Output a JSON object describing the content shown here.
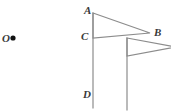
{
  "figure": {
    "background_color": "#ffffff",
    "stroke_color": "#8c8c8c",
    "label_color": "#3a3a3a",
    "point_color": "#111111",
    "labels": {
      "center_point": "O",
      "vertex_a": "A",
      "vertex_b": "B",
      "vertex_c": "C",
      "vertex_d": "D"
    },
    "points": {
      "O": {
        "x": 13,
        "y": 38
      },
      "A": {
        "x": 93,
        "y": 13
      },
      "B": {
        "x": 150,
        "y": 33
      },
      "C": {
        "x": 93,
        "y": 38
      },
      "D": {
        "x": 93,
        "y": 108
      }
    },
    "shapes": {
      "pole_1": {
        "x": 93,
        "y_top": 13,
        "y_bottom": 108
      },
      "triangle_1": "93,13 150,33 93,38",
      "pole_2": {
        "x": 127,
        "y_top": 38,
        "y_bottom": 110
      },
      "triangle_2": "127,38 176,47 127,56"
    }
  }
}
